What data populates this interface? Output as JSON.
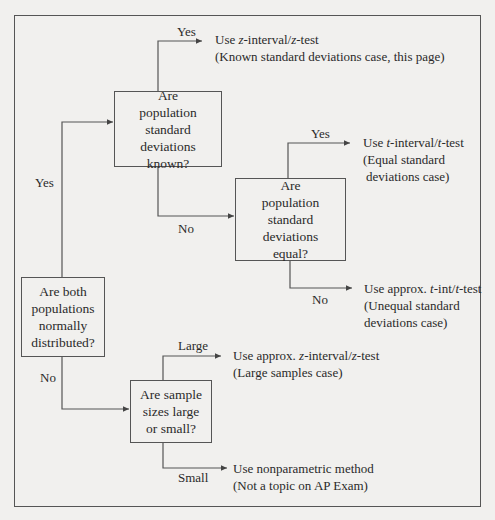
{
  "diagram": {
    "type": "flowchart",
    "decisions": {
      "normal": {
        "text": "Are both populations normally distributed?"
      },
      "known": {
        "text": "Are population standard deviations known?"
      },
      "equal": {
        "text": "Are population standard deviations equal?"
      },
      "sizes": {
        "text": "Are sample sizes large or small?"
      }
    },
    "edge_labels": {
      "normal_yes": "Yes",
      "normal_no": "No",
      "known_yes": "Yes",
      "known_no": "No",
      "equal_yes": "Yes",
      "equal_no": "No",
      "sizes_large": "Large",
      "sizes_small": "Small"
    },
    "results": {
      "z": {
        "line1_pre": "Use ",
        "line1_i1": "z",
        "line1_mid": "-interval/",
        "line1_i2": "z",
        "line1_post": "-test",
        "line2": "(Known standard deviations case, this page)"
      },
      "t_equal": {
        "line1_pre": "Use ",
        "line1_i1": "t",
        "line1_mid": "-interval/",
        "line1_i2": "t",
        "line1_post": "-test",
        "line2": "(Equal standard",
        "line3": "deviations case)"
      },
      "t_unequal": {
        "line1_pre": "Use approx. ",
        "line1_i1": "t",
        "line1_mid": "-int/",
        "line1_i2": "t",
        "line1_post": "-test",
        "line2": "(Unequal standard",
        "line3": "deviations case)"
      },
      "z_large": {
        "line1_pre": "Use approx. ",
        "line1_i1": "z",
        "line1_mid": "-interval/",
        "line1_i2": "z",
        "line1_post": "-test",
        "line2": "(Large samples case)"
      },
      "nonparam": {
        "line1": "Use nonparametric method",
        "line2": "(Not a topic on AP Exam)"
      }
    }
  }
}
